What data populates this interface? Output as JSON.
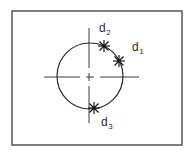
{
  "diagram": {
    "title": "",
    "colors": {
      "background": "#ffffff",
      "frame": "#3a3a3a",
      "circle": "#2a2a2a",
      "axes": "#3a3a3a",
      "markers": "#1a1a1a",
      "labels": "#2a2a2a"
    },
    "frame": {
      "x": 12,
      "y": 11,
      "width": 170,
      "height": 134
    },
    "circle": {
      "cx": 90,
      "cy": 76,
      "r": 33
    },
    "axes": {
      "horizontal": {
        "y": 77,
        "segments": [
          [
            44,
            80
          ],
          [
            86,
            94
          ],
          [
            100,
            139
          ]
        ]
      },
      "vertical": {
        "x": 89,
        "segments": [
          [
            28,
            68
          ],
          [
            73,
            81
          ],
          [
            86,
            123
          ]
        ]
      }
    },
    "points": [
      {
        "id": "d1",
        "label_main": "d",
        "label_sub": "1",
        "marker": {
          "x": 119,
          "y": 61
        },
        "label_pos": {
          "x": 132,
          "y": 51
        }
      },
      {
        "id": "d2",
        "label_main": "d",
        "label_sub": "2",
        "marker": {
          "x": 104,
          "y": 46
        },
        "label_pos": {
          "x": 99,
          "y": 32
        }
      },
      {
        "id": "d3",
        "label_main": "d",
        "label_sub": "3",
        "marker": {
          "x": 94,
          "y": 108
        },
        "label_pos": {
          "x": 101,
          "y": 126
        }
      }
    ]
  }
}
